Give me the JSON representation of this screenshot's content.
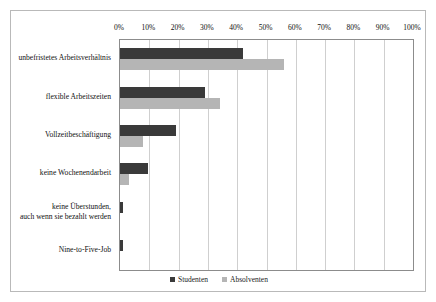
{
  "chart_data": {
    "type": "bar",
    "orientation": "horizontal",
    "title": "",
    "subtitle": "",
    "xlabel": "",
    "ylabel": "",
    "xlim": [
      0,
      100
    ],
    "xtick_labels": [
      "0%",
      "10%",
      "20%",
      "30%",
      "40%",
      "50%",
      "60%",
      "70%",
      "80%",
      "90%",
      "100%"
    ],
    "xtick_values": [
      0,
      10,
      20,
      30,
      40,
      50,
      60,
      70,
      80,
      90,
      100
    ],
    "grid": "vertical",
    "legend_position": "bottom-center",
    "categories": [
      "unbefristetes Arbeitsverhältnis",
      "flexible Arbeitszeiten",
      "Vollzeitbeschäftigung",
      "keine Wochenendarbeit",
      "keine Überstunden,\nauch wenn sie bezahlt werden",
      "Nine-to-Five-Job"
    ],
    "series": [
      {
        "name": "Studenten",
        "color": "#3a3a3a",
        "values": [
          42,
          29,
          19,
          9.5,
          1,
          1
        ]
      },
      {
        "name": "Absolventen",
        "color": "#b5b5b5",
        "values": [
          56,
          34,
          8,
          3,
          0,
          0
        ]
      }
    ]
  },
  "legend": {
    "items": [
      {
        "label": "Studenten",
        "color": "#3a3a3a"
      },
      {
        "label": "Absolventen",
        "color": "#b5b5b5"
      }
    ]
  }
}
